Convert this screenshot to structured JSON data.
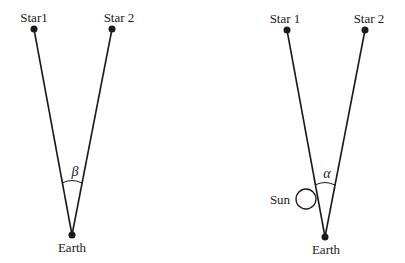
{
  "diagram": {
    "panels": [
      {
        "id": "left",
        "stars": [
          {
            "label": "Star1",
            "x": 34,
            "y": 29,
            "label_x": 34,
            "label_y": 22
          },
          {
            "label": "Star 2",
            "x": 112,
            "y": 29,
            "label_x": 119,
            "label_y": 22
          }
        ],
        "earth": {
          "label": "Earth",
          "x": 72,
          "y": 235,
          "label_x": 72,
          "label_y": 252
        },
        "angle": {
          "symbol": "β",
          "label_x": 75,
          "label_y": 176,
          "arc_radius": 55
        }
      },
      {
        "id": "right",
        "stars": [
          {
            "label": "Star 1",
            "x": 287,
            "y": 30,
            "label_x": 285,
            "label_y": 23
          },
          {
            "label": "Star 2",
            "x": 365,
            "y": 30,
            "label_x": 369,
            "label_y": 23
          },
          {
            "placeholder": true
          }
        ],
        "earth": {
          "label": "Earth",
          "x": 325,
          "y": 237,
          "label_x": 326,
          "label_y": 254
        },
        "angle": {
          "symbol": "α",
          "label_x": 327,
          "label_y": 178,
          "arc_radius": 55
        },
        "sun": {
          "label": "Sun",
          "cx": 306,
          "cy": 199,
          "r": 10,
          "label_x": 280,
          "label_y": 204
        }
      }
    ],
    "colors": {
      "ink": "#1a1a1a",
      "background": "#ffffff"
    }
  }
}
